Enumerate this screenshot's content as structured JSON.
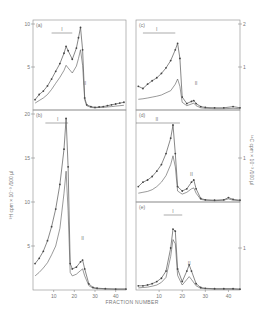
{
  "figure": {
    "xlabel": "FRACTION NUMBER",
    "ylabel_left": "³H cpm × 10⁻³ /100 µl",
    "ylabel_right": "¹⁴C cpm × 10⁻³ /100 µl",
    "peak_labels": [
      "I",
      "II"
    ],
    "colors": {
      "axis": "#8a8a8a",
      "line": "#555555",
      "marker": "#444444",
      "background": "#ffffff"
    }
  },
  "chart_data": [
    {
      "type": "line",
      "panel": "(a)",
      "title": "(a)",
      "xlabel": "FRACTION NUMBER",
      "ylabel": "³H cpm × 10⁻³ /100 µl",
      "xlim": [
        0,
        45
      ],
      "ylim": [
        0,
        10
      ],
      "yticks": [
        5,
        10
      ],
      "x": [
        1,
        3,
        5,
        7,
        9,
        11,
        13,
        15,
        16,
        17,
        19,
        21,
        22,
        23,
        24,
        25,
        26,
        28,
        30,
        32,
        34,
        36,
        38,
        40,
        42,
        44
      ],
      "series": [
        {
          "name": "³H (dots)",
          "values": [
            1.2,
            1.8,
            2.2,
            2.8,
            3.6,
            4.5,
            5.4,
            6.6,
            7.4,
            6.9,
            5.9,
            7.2,
            8.4,
            9.6,
            7.0,
            1.4,
            0.6,
            0.4,
            0.3,
            0.35,
            0.4,
            0.5,
            0.6,
            0.7,
            0.8,
            0.9
          ]
        },
        {
          "name": "¹⁴C (line)",
          "values": [
            0.8,
            1.1,
            1.4,
            1.8,
            2.4,
            3.1,
            3.8,
            4.6,
            5.2,
            4.9,
            4.3,
            5.1,
            6.0,
            7.0,
            5.2,
            1.2,
            0.5,
            0.3,
            0.25,
            0.3,
            0.3,
            0.35,
            0.4,
            0.45,
            0.5,
            0.55
          ]
        }
      ],
      "annotations": [
        {
          "text": "I",
          "x": 14,
          "span": [
            9,
            19
          ]
        },
        {
          "text": "II",
          "x": 25
        }
      ]
    },
    {
      "type": "line",
      "panel": "(b)",
      "title": "(b)",
      "xlabel": "FRACTION NUMBER",
      "ylabel": "³H cpm × 10⁻³ /100 µl",
      "xlim": [
        0,
        45
      ],
      "ylim": [
        0,
        20
      ],
      "yticks": [
        5,
        10,
        15,
        20
      ],
      "x": [
        1,
        3,
        5,
        7,
        9,
        11,
        13,
        15,
        16,
        17,
        18,
        19,
        21,
        23,
        24,
        25,
        27,
        29,
        31,
        35,
        40,
        45
      ],
      "series": [
        {
          "name": "³H (dots)",
          "values": [
            3.0,
            3.6,
            4.4,
            5.6,
            7.2,
            9.2,
            12.0,
            16.0,
            19.5,
            14.0,
            3.0,
            2.4,
            2.6,
            3.2,
            3.4,
            2.4,
            0.7,
            0.3,
            0.2,
            0.15,
            0.1,
            0.1
          ]
        },
        {
          "name": "¹⁴C (line)",
          "values": [
            1.6,
            2.0,
            2.5,
            3.1,
            4.0,
            5.0,
            7.0,
            11.0,
            13.5,
            9.0,
            2.0,
            1.6,
            1.8,
            2.2,
            2.4,
            1.6,
            0.5,
            0.2,
            0.15,
            0.1,
            0.1,
            0.1
          ]
        }
      ],
      "annotations": [
        {
          "text": "I",
          "x": 12,
          "span": [
            6,
            17
          ]
        },
        {
          "text": "II",
          "x": 24
        }
      ]
    },
    {
      "type": "line",
      "panel": "(c)",
      "title": "(c)",
      "xlabel": "FRACTION NUMBER",
      "ylabel": "¹⁴C cpm × 10⁻³ /100 µl",
      "xlim": [
        0,
        45
      ],
      "ylim": [
        0,
        2
      ],
      "yticks": [
        1,
        2
      ],
      "x": [
        1,
        3,
        5,
        7,
        9,
        11,
        13,
        15,
        17,
        18,
        19,
        20,
        22,
        24,
        25,
        26,
        28,
        30,
        34,
        38,
        42,
        45
      ],
      "series": [
        {
          "name": "³H (dots)",
          "values": [
            0.55,
            0.5,
            0.6,
            0.68,
            0.75,
            0.85,
            0.98,
            1.15,
            1.4,
            1.55,
            1.2,
            0.3,
            0.15,
            0.2,
            0.22,
            0.15,
            0.08,
            0.06,
            0.05,
            0.05,
            0.08,
            0.05
          ]
        },
        {
          "name": "¹⁴C (line)",
          "values": [
            0.25,
            0.26,
            0.28,
            0.3,
            0.32,
            0.35,
            0.4,
            0.45,
            0.6,
            0.72,
            0.55,
            0.18,
            0.1,
            0.14,
            0.16,
            0.1,
            0.05,
            0.04,
            0.03,
            0.03,
            0.04,
            0.03
          ]
        }
      ],
      "annotations": [
        {
          "text": "I",
          "x": 9,
          "span": [
            3,
            17
          ]
        },
        {
          "text": "II",
          "x": 26
        }
      ]
    },
    {
      "type": "line",
      "panel": "(d)",
      "title": "(d)",
      "xlabel": "FRACTION NUMBER",
      "ylabel": "¹⁴C cpm × 10⁻³ /100 µl",
      "xlim": [
        0,
        45
      ],
      "ylim": [
        0,
        2
      ],
      "yticks": [
        1
      ],
      "x": [
        1,
        3,
        5,
        7,
        9,
        11,
        13,
        15,
        16,
        17,
        18,
        20,
        22,
        24,
        25,
        26,
        28,
        30,
        34,
        38,
        40,
        42,
        45
      ],
      "series": [
        {
          "name": "³H (dots)",
          "values": [
            0.35,
            0.45,
            0.5,
            0.58,
            0.7,
            0.85,
            1.1,
            1.45,
            1.75,
            1.1,
            0.35,
            0.25,
            0.3,
            0.45,
            0.5,
            0.3,
            0.08,
            0.05,
            0.04,
            0.05,
            0.1,
            0.06,
            0.04
          ]
        },
        {
          "name": "¹⁴C (line)",
          "values": [
            0.2,
            0.22,
            0.24,
            0.28,
            0.35,
            0.45,
            0.6,
            0.85,
            1.05,
            0.8,
            0.25,
            0.18,
            0.22,
            0.3,
            0.32,
            0.2,
            0.06,
            0.04,
            0.03,
            0.04,
            0.07,
            0.04,
            0.03
          ]
        }
      ],
      "annotations": [
        {
          "text": "II",
          "x": 9,
          "span": [
            0,
            19
          ]
        },
        {
          "text": "II",
          "x": 24
        }
      ]
    },
    {
      "type": "line",
      "panel": "(e)",
      "title": "(e)",
      "xlabel": "FRACTION NUMBER",
      "ylabel": "¹⁴C cpm × 10⁻³ /100 µl",
      "xlim": [
        0,
        45
      ],
      "ylim": [
        0,
        2
      ],
      "yticks": [
        1
      ],
      "xticks": [
        10,
        20,
        30,
        40
      ],
      "x": [
        1,
        3,
        5,
        7,
        9,
        11,
        13,
        15,
        16,
        17,
        18,
        20,
        22,
        23,
        24,
        26,
        28,
        30,
        34,
        38,
        42,
        45
      ],
      "series": [
        {
          "name": "³H (dots)",
          "values": [
            0.1,
            0.1,
            0.12,
            0.15,
            0.2,
            0.28,
            0.45,
            1.0,
            1.45,
            1.4,
            0.5,
            0.2,
            0.45,
            0.6,
            0.45,
            0.15,
            0.06,
            0.04,
            0.03,
            0.03,
            0.03,
            0.02
          ]
        },
        {
          "name": "¹⁴C (line)",
          "values": [
            0.05,
            0.06,
            0.07,
            0.09,
            0.12,
            0.18,
            0.3,
            0.8,
            1.2,
            1.1,
            0.35,
            0.12,
            0.25,
            0.32,
            0.25,
            0.1,
            0.04,
            0.03,
            0.02,
            0.02,
            0.02,
            0.02
          ]
        }
      ],
      "annotations": [
        {
          "text": "I",
          "x": 16,
          "span": [
            12,
            20
          ]
        },
        {
          "text": "II",
          "x": 23
        }
      ]
    }
  ],
  "axes": {
    "left_xticks": [
      "10",
      "20",
      "30",
      "40"
    ],
    "right_xticks": [
      "10",
      "20",
      "30",
      "40"
    ],
    "left_yticks_a": [
      "5",
      "10"
    ],
    "left_yticks_b": [
      "5",
      "10",
      "15"
    ],
    "right_yticks_c": [
      "1",
      "2"
    ],
    "right_yticks_d": [
      "1"
    ],
    "right_yticks_e": [
      "1"
    ]
  }
}
